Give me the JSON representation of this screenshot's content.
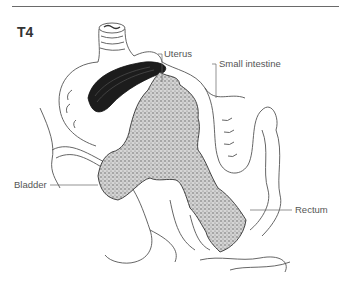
{
  "figure": {
    "stage": "T4",
    "labels": {
      "uterus": "Uterus",
      "small_intestine": "Small intestine",
      "bladder": "Bladder",
      "rectum": "Rectum"
    },
    "colors": {
      "line": "#555555",
      "tumor_fill": "#c8c8c8",
      "tumor_dark": "#3a3a3a",
      "uterus_dark": "#1a1a1a"
    }
  }
}
